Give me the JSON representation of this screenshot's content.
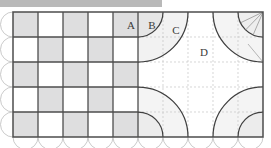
{
  "figure": {
    "header_bar": {
      "name": "top-gray-bar",
      "color": "#b9b9b9",
      "x": 0,
      "y": 0,
      "width": 162,
      "height": 7
    },
    "board": {
      "x": 13,
      "y": 12,
      "width": 250,
      "height": 125,
      "cell": 25,
      "cols": 10,
      "rows": 5,
      "stroke": "#555555",
      "background": "#ffffff"
    },
    "colors": {
      "fill_gray": "#dededf",
      "fill_light": "#f1f1f1",
      "stroke_dark": "#4d4d4d",
      "stroke_mid": "#6f6f6f",
      "stroke_light": "#bcbcbc",
      "stroke_dotted": "#c4c4c4",
      "label_color": "#3a3a3a",
      "page_background": "#ffffff"
    },
    "checkerboard": {
      "name": "left-checkerboard",
      "cols": 5,
      "rows": 5,
      "note": "alternating shaded squares, solid grid lines",
      "shaded_cells": [
        [
          0,
          0
        ],
        [
          2,
          0
        ],
        [
          4,
          0
        ],
        [
          1,
          1
        ],
        [
          3,
          1
        ],
        [
          0,
          2
        ],
        [
          2,
          2
        ],
        [
          4,
          2
        ],
        [
          1,
          3
        ],
        [
          3,
          3
        ],
        [
          0,
          4
        ],
        [
          2,
          4
        ],
        [
          4,
          4
        ]
      ]
    },
    "labels": [
      {
        "text": "A",
        "x": 131,
        "y": 25,
        "name": "label-a"
      },
      {
        "text": "B",
        "x": 152,
        "y": 25,
        "name": "label-b"
      },
      {
        "text": "C",
        "x": 175,
        "y": 30,
        "name": "label-c"
      },
      {
        "text": "D",
        "x": 203,
        "y": 52,
        "name": "label-d"
      }
    ],
    "label_list": [
      "A",
      "B",
      "C",
      "D"
    ],
    "arcs": {
      "note": "quarter circles of increasing radius nested at the four corners of the right half",
      "top_left_group": [
        {
          "cx": 138,
          "cy": 12,
          "r": 25,
          "name": "arc-b"
        },
        {
          "cx": 138,
          "cy": 12,
          "r": 50,
          "name": "arc-c"
        }
      ],
      "top_right_group": [
        {
          "cx": 263,
          "cy": 12,
          "r": 25,
          "name": "arc-corner-small"
        },
        {
          "cx": 263,
          "cy": 12,
          "r": 50,
          "name": "arc-corner-large"
        }
      ],
      "bottom_left_group": [
        {
          "cx": 138,
          "cy": 137,
          "r": 25,
          "name": "arc-bl-small"
        },
        {
          "cx": 138,
          "cy": 137,
          "r": 50,
          "name": "arc-bl-large"
        }
      ],
      "bottom_right_group": [
        {
          "cx": 263,
          "cy": 137,
          "r": 25,
          "name": "arc-br-small"
        },
        {
          "cx": 263,
          "cy": 137,
          "r": 50,
          "name": "arc-br-large"
        }
      ]
    },
    "radii_lines": {
      "name": "corner-radius-fan",
      "note": "three thin radii drawn from the top-right corner into the small sector",
      "origin": {
        "x": 263,
        "y": 12
      },
      "count": 3
    },
    "scallops": {
      "name": "edge-scallops",
      "radius": 12.5,
      "left_count": 5,
      "bottom_count": 10,
      "stroke": "#bcbcbc"
    },
    "dotted_grid": {
      "name": "right-dotted-grid",
      "x": 138,
      "y": 12,
      "cols": 5,
      "rows": 5,
      "cell": 25,
      "stroke": "#c4c4c4",
      "dash": "2 2"
    }
  }
}
